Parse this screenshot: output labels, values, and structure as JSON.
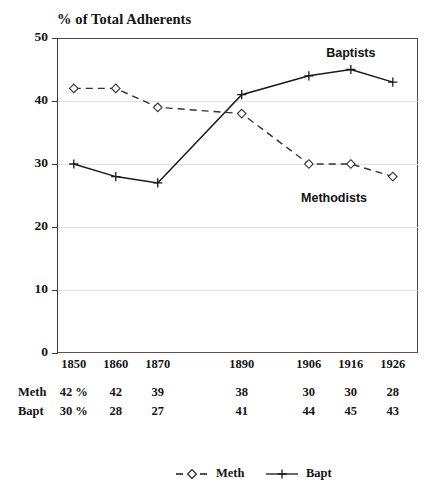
{
  "chart_data": {
    "type": "line",
    "title": "% of Total Adherents",
    "xlabel": "",
    "ylabel": "",
    "ylim": [
      0,
      50
    ],
    "yticks": [
      0,
      10,
      20,
      30,
      40,
      50
    ],
    "ytick_labels": [
      "0",
      "10",
      "20",
      "30",
      "40",
      "50"
    ],
    "grid": true,
    "grid_axis": "y",
    "legend_position": "bottom-center",
    "categories": [
      "1850",
      "1860",
      "1870",
      "1890",
      "1906",
      "1916",
      "1926"
    ],
    "x_positions": [
      1850,
      1860,
      1870,
      1890,
      1906,
      1916,
      1926
    ],
    "series": [
      {
        "name": "Meth",
        "label": "Meth",
        "annotation": "Methodists",
        "marker": "open-diamond",
        "linestyle": "dashed",
        "color": "#333333",
        "values": [
          42,
          42,
          39,
          38,
          30,
          30,
          28
        ],
        "value_labels": [
          "42 %",
          "42",
          "39",
          "38",
          "30",
          "30",
          "28"
        ]
      },
      {
        "name": "Bapt",
        "label": "Bapt",
        "annotation": "Baptists",
        "marker": "plus",
        "linestyle": "solid",
        "color": "#1a1a1a",
        "values": [
          30,
          28,
          27,
          41,
          44,
          45,
          43
        ],
        "value_labels": [
          "30 %",
          "28",
          "27",
          "41",
          "44",
          "45",
          "43"
        ]
      }
    ],
    "annotations": [
      {
        "text": "Baptists",
        "x": 1916,
        "y": 47.5
      },
      {
        "text": "Methodists",
        "x": 1912,
        "y": 24.5
      }
    ]
  },
  "table": {
    "rows": [
      {
        "label": "Meth",
        "cells": [
          "42 %",
          "42",
          "39",
          "38",
          "30",
          "30",
          "28"
        ]
      },
      {
        "label": "Bapt",
        "cells": [
          "30 %",
          "28",
          "27",
          "41",
          "44",
          "45",
          "43"
        ]
      }
    ]
  },
  "legend": {
    "entries": [
      {
        "label": "Meth",
        "marker": "open-diamond",
        "linestyle": "dashed"
      },
      {
        "label": "Bapt",
        "marker": "plus",
        "linestyle": "solid"
      }
    ]
  }
}
